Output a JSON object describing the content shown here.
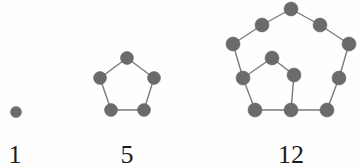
{
  "diagram": {
    "background_color": "#fefefe",
    "dot_color": "#6b6b6b",
    "edge_color": "#7a7a7a",
    "caption_color": "#1b1b1b",
    "figures": [
      {
        "id": "pentagonal-1",
        "caption": "1",
        "dot_count": 1,
        "caption_x": 15,
        "caption_y": 163,
        "dot_radius": 5.5,
        "dots": [
          {
            "name": "center-dot",
            "x": 16,
            "y": 112
          }
        ],
        "edges": []
      },
      {
        "id": "pentagonal-5",
        "caption": "5",
        "dot_count": 5,
        "caption_x": 127,
        "caption_y": 163,
        "dot_radius": 6.5,
        "dots": [
          {
            "name": "apex-dot",
            "x": 127,
            "y": 58
          },
          {
            "name": "upper-left-dot",
            "x": 100,
            "y": 78
          },
          {
            "name": "upper-right-dot",
            "x": 154,
            "y": 78
          },
          {
            "name": "lower-left-dot",
            "x": 111,
            "y": 110
          },
          {
            "name": "lower-right-dot",
            "x": 144,
            "y": 110
          }
        ],
        "edges": [
          {
            "x1": 127,
            "y1": 58,
            "x2": 100,
            "y2": 78
          },
          {
            "x1": 127,
            "y1": 58,
            "x2": 154,
            "y2": 78
          },
          {
            "x1": 100,
            "y1": 78,
            "x2": 111,
            "y2": 110
          },
          {
            "x1": 154,
            "y1": 78,
            "x2": 144,
            "y2": 110
          },
          {
            "x1": 111,
            "y1": 110,
            "x2": 144,
            "y2": 110
          }
        ]
      },
      {
        "id": "pentagonal-12",
        "caption": "12",
        "dot_count": 12,
        "caption_x": 291,
        "caption_y": 163,
        "dot_radius": 7,
        "dots": [
          {
            "name": "outer-apex-dot",
            "x": 291,
            "y": 9
          },
          {
            "name": "outer-upper-left-mid-dot",
            "x": 262,
            "y": 25
          },
          {
            "name": "outer-upper-right-mid-dot",
            "x": 320,
            "y": 25
          },
          {
            "name": "outer-left-dot",
            "x": 233,
            "y": 44
          },
          {
            "name": "outer-right-dot",
            "x": 349,
            "y": 44
          },
          {
            "name": "outer-lower-left-mid-dot",
            "x": 243,
            "y": 78
          },
          {
            "name": "outer-lower-right-mid-dot",
            "x": 339,
            "y": 78
          },
          {
            "name": "outer-bottom-left-dot",
            "x": 255,
            "y": 110
          },
          {
            "name": "outer-bottom-right-dot",
            "x": 327,
            "y": 110
          },
          {
            "name": "inner-apex-dot",
            "x": 272,
            "y": 58
          },
          {
            "name": "inner-right-dot",
            "x": 294,
            "y": 75
          },
          {
            "name": "inner-bottom-right-dot",
            "x": 291,
            "y": 110
          }
        ],
        "edges": [
          {
            "x1": 291,
            "y1": 9,
            "x2": 262,
            "y2": 25
          },
          {
            "x1": 291,
            "y1": 9,
            "x2": 320,
            "y2": 25
          },
          {
            "x1": 262,
            "y1": 25,
            "x2": 233,
            "y2": 44
          },
          {
            "x1": 320,
            "y1": 25,
            "x2": 349,
            "y2": 44
          },
          {
            "x1": 233,
            "y1": 44,
            "x2": 243,
            "y2": 78
          },
          {
            "x1": 349,
            "y1": 44,
            "x2": 339,
            "y2": 78
          },
          {
            "x1": 243,
            "y1": 78,
            "x2": 255,
            "y2": 110
          },
          {
            "x1": 339,
            "y1": 78,
            "x2": 327,
            "y2": 110
          },
          {
            "x1": 255,
            "y1": 110,
            "x2": 291,
            "y2": 110
          },
          {
            "x1": 291,
            "y1": 110,
            "x2": 327,
            "y2": 110
          },
          {
            "x1": 272,
            "y1": 58,
            "x2": 243,
            "y2": 78
          },
          {
            "x1": 272,
            "y1": 58,
            "x2": 294,
            "y2": 75
          },
          {
            "x1": 294,
            "y1": 75,
            "x2": 291,
            "y2": 110
          }
        ]
      }
    ]
  }
}
